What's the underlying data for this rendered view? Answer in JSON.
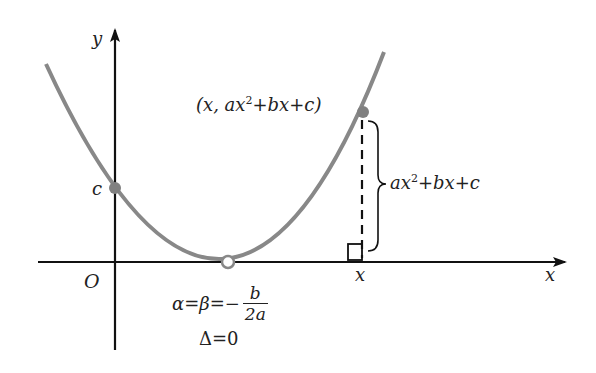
{
  "diagram": {
    "type": "parabola tangent to x-axis",
    "axes": {
      "x_label": "x",
      "y_label": "y",
      "origin_label": "O"
    },
    "labels": {
      "y_intercept": "c",
      "point": "(x, ax",
      "point_sup": "2",
      "point_tail": "+bx+c)",
      "brace_label": "ax",
      "brace_sup": "2",
      "brace_tail": "+bx+c",
      "foot_x": "x",
      "vertex_eq": "α=β=−",
      "frac_num": "b",
      "frac_den": "2a",
      "discriminant": "Δ=0"
    },
    "colors": {
      "curve": "#888888",
      "axes": "#111111",
      "point_fill": "#808080"
    }
  }
}
